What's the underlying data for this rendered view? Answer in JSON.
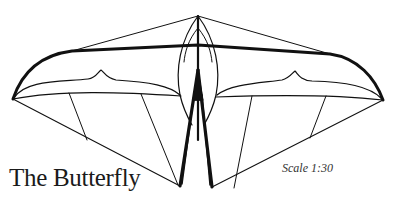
{
  "diagram": {
    "title": "The Butterfly",
    "scale_label": "Scale 1:30",
    "colors": {
      "line": "#111111",
      "background": "#ffffff"
    }
  }
}
